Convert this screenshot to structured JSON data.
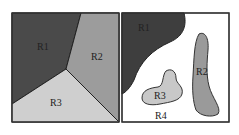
{
  "panels": [
    {
      "name": "left-partition",
      "regions": [
        {
          "label": "R1",
          "color": "#4a4a4a"
        },
        {
          "label": "R2",
          "color": "#9c9c9c"
        },
        {
          "label": "R3",
          "color": "#cfcfcf"
        }
      ]
    },
    {
      "name": "right-partition",
      "regions": [
        {
          "label": "R1",
          "color": "#3e3e3e"
        },
        {
          "label": "R2",
          "color": "#9a9a9a"
        },
        {
          "label": "R3",
          "color": "#c8c8c8"
        },
        {
          "label": "R4",
          "color": "#ffffff"
        }
      ]
    }
  ]
}
